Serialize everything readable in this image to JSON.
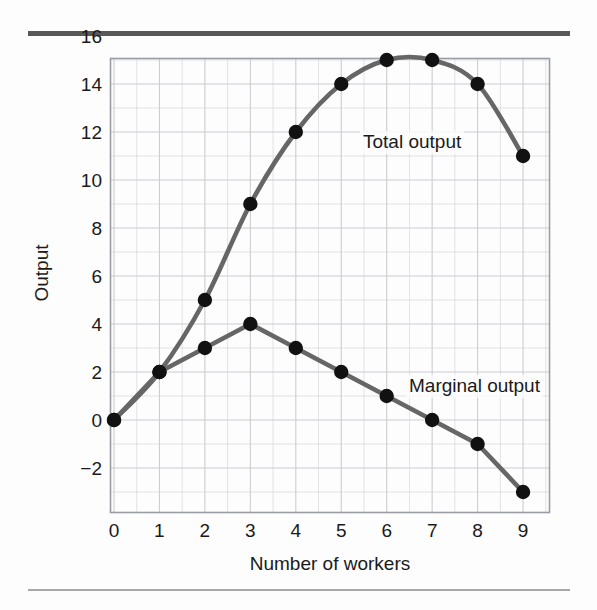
{
  "chart_data": {
    "type": "line",
    "title": "",
    "xlabel": "Number of workers",
    "ylabel": "Output",
    "x": [
      0,
      1,
      2,
      3,
      4,
      5,
      6,
      7,
      8,
      9
    ],
    "xlim": [
      0,
      9.5
    ],
    "ylim": [
      -3.5,
      16
    ],
    "xticks": [
      "0",
      "1",
      "2",
      "3",
      "4",
      "5",
      "6",
      "7",
      "8",
      "9"
    ],
    "yticks": [
      "16",
      "14",
      "12",
      "10",
      "8",
      "6",
      "4",
      "2",
      "0",
      "−2"
    ],
    "ytick_values": [
      16,
      14,
      12,
      10,
      8,
      6,
      4,
      2,
      0,
      -2
    ],
    "grid": true,
    "grid_minor_step": 1,
    "grid_color": "#c9ccd1",
    "legend_position": "inline-annotations",
    "series": [
      {
        "name": "Total output",
        "values": [
          0,
          2,
          5,
          9,
          12,
          14,
          15,
          15,
          14,
          11
        ],
        "style": "smooth",
        "color": "#666666",
        "marker": "filled-circle",
        "marker_color": "#111111"
      },
      {
        "name": "Marginal output",
        "values": [
          0,
          2,
          3,
          4,
          3,
          2,
          1,
          0,
          -1,
          -3
        ],
        "style": "straight",
        "color": "#666666",
        "marker": "filled-circle",
        "marker_color": "#111111"
      }
    ],
    "annotations": [
      {
        "text": "Total output",
        "x": 5.5,
        "y": 12.2
      },
      {
        "text": "Marginal output",
        "x": 6.5,
        "y": 1.6
      }
    ]
  },
  "figure": {
    "top_rule_color": "#595959",
    "bottom_rule_color": "#a8a8a8",
    "background": "#fdfdfd"
  }
}
